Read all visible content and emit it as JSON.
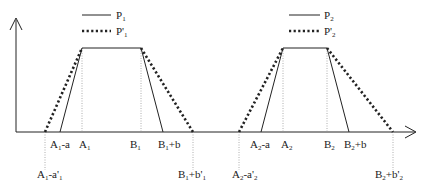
{
  "diagram": {
    "title": "",
    "colors": {
      "line": "#222222",
      "guide": "#999999",
      "background": "#ffffff"
    },
    "legends": [
      {
        "solid": {
          "base": "P",
          "sub": "1"
        },
        "dotted": {
          "base": "P'",
          "sub": "1"
        }
      },
      {
        "solid": {
          "base": "P",
          "sub": "2"
        },
        "dotted": {
          "base": "P'",
          "sub": "2"
        }
      }
    ],
    "trapezoids": [
      {
        "name": "P1",
        "labels": {
          "outer_left": {
            "a": "A",
            "s1": "1",
            "b": "-a'",
            "s2": "1"
          },
          "inner_left": {
            "a": "A",
            "s1": "1",
            "b": "-a"
          },
          "top_left": {
            "a": "A",
            "s1": "1"
          },
          "top_right": {
            "a": "B",
            "s1": "1"
          },
          "inner_right": {
            "a": "B",
            "s1": "1",
            "b": "+b"
          },
          "outer_right": {
            "a": "B",
            "s1": "1",
            "b": "+b'",
            "s2": "1"
          }
        }
      },
      {
        "name": "P2",
        "labels": {
          "outer_left": {
            "a": "A",
            "s1": "2",
            "b": "-a'",
            "s2": "2"
          },
          "inner_left": {
            "a": "A",
            "s1": "2",
            "b": "-a"
          },
          "top_left": {
            "a": "A",
            "s1": "2"
          },
          "top_right": {
            "a": "B",
            "s1": "2"
          },
          "inner_right": {
            "a": "B",
            "s1": "2",
            "b": "+b"
          },
          "outer_right": {
            "a": "B",
            "s1": "2",
            "b": "+b'",
            "s2": "2"
          }
        }
      }
    ]
  }
}
